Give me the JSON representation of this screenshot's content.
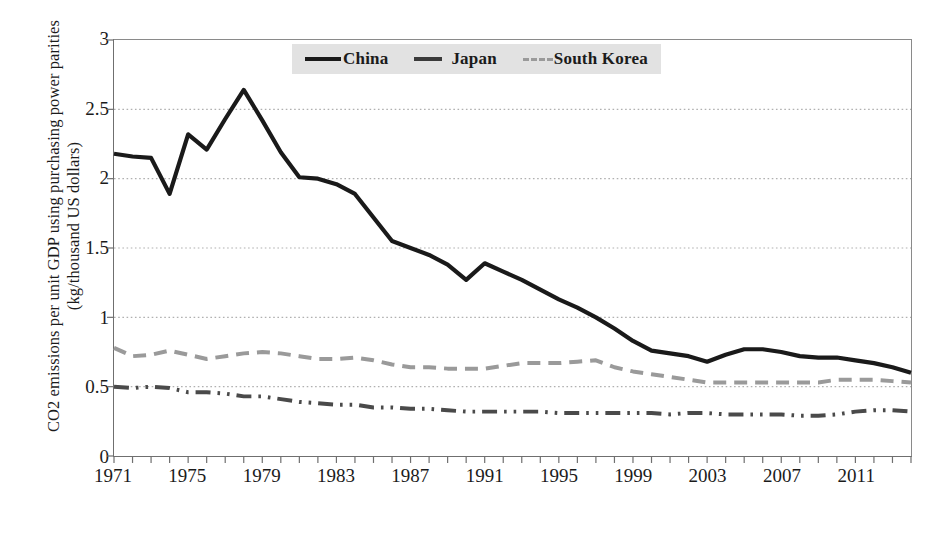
{
  "chart_data": {
    "type": "line",
    "title": "",
    "xlabel": "",
    "ylabel": "CO2 emissions per unit GDP using purchasing power parities\n(kg/thousand US dollars)",
    "ylim": [
      0,
      3
    ],
    "yticks": [
      "0",
      "0.5",
      "1",
      "1.5",
      "2",
      "2.5",
      "3"
    ],
    "ytick_values": [
      0,
      0.5,
      1,
      1.5,
      2,
      2.5,
      3
    ],
    "xlim": [
      1971,
      2014
    ],
    "xticks": [
      "1971",
      "1975",
      "1979",
      "1983",
      "1987",
      "1991",
      "1995",
      "1999",
      "2003",
      "2007",
      "2011"
    ],
    "xtick_values": [
      1971,
      1975,
      1979,
      1983,
      1987,
      1991,
      1995,
      1999,
      2003,
      2007,
      2011
    ],
    "grid": true,
    "grid_style": "dotted",
    "legend_position": "top-center",
    "x": [
      1971,
      1972,
      1973,
      1974,
      1975,
      1976,
      1977,
      1978,
      1979,
      1980,
      1981,
      1982,
      1983,
      1984,
      1985,
      1986,
      1987,
      1988,
      1989,
      1990,
      1991,
      1992,
      1993,
      1994,
      1995,
      1996,
      1997,
      1998,
      1999,
      2000,
      2001,
      2002,
      2003,
      2004,
      2005,
      2006,
      2007,
      2008,
      2009,
      2010,
      2011,
      2012,
      2013,
      2014
    ],
    "series": [
      {
        "name": "China",
        "color": "#1a1a1a",
        "style": "solid",
        "width": 4.2,
        "values": [
          2.18,
          2.16,
          2.15,
          1.89,
          2.32,
          2.21,
          2.43,
          2.64,
          2.42,
          2.19,
          2.01,
          2.0,
          1.96,
          1.89,
          1.72,
          1.55,
          1.5,
          1.45,
          1.38,
          1.27,
          1.39,
          1.33,
          1.27,
          1.2,
          1.13,
          1.07,
          1.0,
          0.92,
          0.83,
          0.76,
          0.74,
          0.72,
          0.68,
          0.73,
          0.77,
          0.77,
          0.75,
          0.72,
          0.71,
          0.71,
          0.69,
          0.67,
          0.64,
          0.6
        ]
      },
      {
        "name": "Japan",
        "color": "#4a4a4a",
        "style": "dashdotdot",
        "width": 4.0,
        "values": [
          0.5,
          0.49,
          0.5,
          0.49,
          0.46,
          0.46,
          0.45,
          0.43,
          0.43,
          0.41,
          0.39,
          0.38,
          0.37,
          0.37,
          0.35,
          0.35,
          0.34,
          0.34,
          0.33,
          0.32,
          0.32,
          0.32,
          0.32,
          0.32,
          0.31,
          0.31,
          0.31,
          0.31,
          0.31,
          0.31,
          0.3,
          0.31,
          0.31,
          0.3,
          0.3,
          0.3,
          0.3,
          0.29,
          0.29,
          0.3,
          0.32,
          0.33,
          0.33,
          0.32
        ]
      },
      {
        "name": "South Korea",
        "color": "#9a9a9a",
        "style": "dashed",
        "width": 4.0,
        "values": [
          0.78,
          0.72,
          0.73,
          0.76,
          0.73,
          0.7,
          0.72,
          0.74,
          0.75,
          0.74,
          0.72,
          0.7,
          0.7,
          0.71,
          0.69,
          0.66,
          0.64,
          0.64,
          0.63,
          0.63,
          0.63,
          0.65,
          0.67,
          0.67,
          0.67,
          0.68,
          0.69,
          0.64,
          0.61,
          0.59,
          0.57,
          0.55,
          0.53,
          0.53,
          0.53,
          0.53,
          0.53,
          0.53,
          0.53,
          0.55,
          0.55,
          0.55,
          0.54,
          0.53
        ]
      }
    ]
  },
  "legend": {
    "items": [
      {
        "label": "China"
      },
      {
        "label": "Japan"
      },
      {
        "label": "South Korea"
      }
    ]
  }
}
